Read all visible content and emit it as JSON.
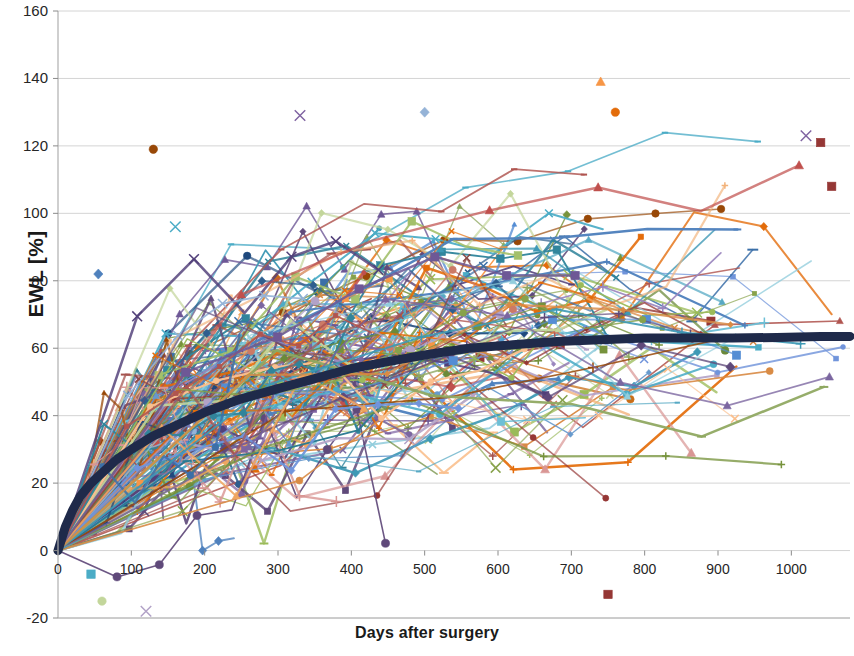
{
  "chart_data": {
    "type": "line",
    "title": "",
    "subtitle": "",
    "xlabel": "Days after surgery",
    "ylabel": "EWL [%]",
    "xlim": [
      0,
      1080
    ],
    "ylim": [
      -20,
      160
    ],
    "xticks": [
      0,
      100,
      200,
      300,
      400,
      500,
      600,
      700,
      800,
      900,
      1000
    ],
    "yticks": [
      -20,
      0,
      20,
      40,
      60,
      80,
      100,
      120,
      140,
      160
    ],
    "grid": "horizontal",
    "legend": "none",
    "series_count": 180,
    "mean_series": {
      "name": "Mean EWL",
      "color": "#1F2A4A",
      "linewidth": 9,
      "marker": "none",
      "x": [
        0,
        10,
        20,
        30,
        45,
        60,
        80,
        100,
        130,
        160,
        200,
        250,
        300,
        350,
        400,
        450,
        500,
        560,
        620,
        680,
        740,
        800,
        860,
        920,
        980,
        1040,
        1080
      ],
      "y": [
        0,
        7,
        12,
        16,
        20,
        23,
        27,
        30,
        34,
        37,
        41,
        45,
        48,
        51,
        54,
        56,
        58,
        60,
        61,
        62,
        62.5,
        63,
        63,
        63,
        63.2,
        63.5,
        63.5
      ]
    },
    "palette": [
      "#4F81BD",
      "#C0504D",
      "#9BBB59",
      "#8064A2",
      "#4BACC6",
      "#F79646",
      "#1F497D",
      "#953735",
      "#77933C",
      "#5F497A",
      "#31859C",
      "#E36C0A",
      "#95B3D7",
      "#D99694",
      "#C3D69B",
      "#B2A2C7",
      "#92CDDC",
      "#FAC08F",
      "#548DD4",
      "#984807",
      "#76923C",
      "#604A7B",
      "#31849B",
      "#E46C0A",
      "#7094DB",
      "#A6544F",
      "#8FA861",
      "#7B66A0",
      "#57A9C4",
      "#EFA560",
      "#3B6FA8",
      "#B05550",
      "#87A24B",
      "#6E5896",
      "#3E99B5",
      "#D98B45",
      "#6699CC",
      "#CC7A66",
      "#A3C06B",
      "#9A86BE",
      "#6DBFD6",
      "#F2B27A",
      "#2E5E8E",
      "#8C4A46",
      "#6B8A3A",
      "#52407A",
      "#2A7A92",
      "#C96E18"
    ],
    "markers": [
      "diamond",
      "square",
      "triangle",
      "x",
      "cross",
      "circle",
      "dash"
    ],
    "axis_color": "#AFAFAF",
    "gridline_color": "#D4D4D4",
    "background": "#FFFFFF",
    "notable_points": [
      {
        "x": 740,
        "y": 139,
        "marker": "triangle",
        "color": "#F79646"
      },
      {
        "x": 760,
        "y": 130,
        "marker": "circle",
        "color": "#E36C0A"
      },
      {
        "x": 500,
        "y": 130,
        "marker": "diamond",
        "color": "#95B3D7"
      },
      {
        "x": 330,
        "y": 129,
        "marker": "x",
        "color": "#8064A2"
      },
      {
        "x": 1020,
        "y": 123,
        "marker": "x",
        "color": "#8064A2"
      },
      {
        "x": 1040,
        "y": 121,
        "marker": "square",
        "color": "#953735"
      },
      {
        "x": 130,
        "y": 119,
        "marker": "circle",
        "color": "#984807"
      },
      {
        "x": 1055,
        "y": 108,
        "marker": "square",
        "color": "#953735"
      },
      {
        "x": 160,
        "y": 96,
        "marker": "x",
        "color": "#4BACC6"
      },
      {
        "x": 55,
        "y": 82,
        "marker": "diamond",
        "color": "#4F81BD"
      },
      {
        "x": 750,
        "y": -13,
        "marker": "square",
        "color": "#953735"
      },
      {
        "x": 60,
        "y": -15,
        "marker": "circle",
        "color": "#C3D69B"
      },
      {
        "x": 120,
        "y": -18,
        "marker": "x",
        "color": "#B2A2C7"
      },
      {
        "x": 45,
        "y": -7,
        "marker": "square",
        "color": "#4BACC6"
      }
    ]
  },
  "axis": {
    "ylabel_text": "EWL [%]",
    "xlabel_text": "Days after surgery",
    "ytick_labels": [
      "160",
      "140",
      "120",
      "100",
      "80",
      "60",
      "40",
      "20",
      "0",
      "-20"
    ],
    "xtick_labels": [
      "0",
      "100",
      "200",
      "300",
      "400",
      "500",
      "600",
      "700",
      "800",
      "900",
      "1000"
    ]
  }
}
